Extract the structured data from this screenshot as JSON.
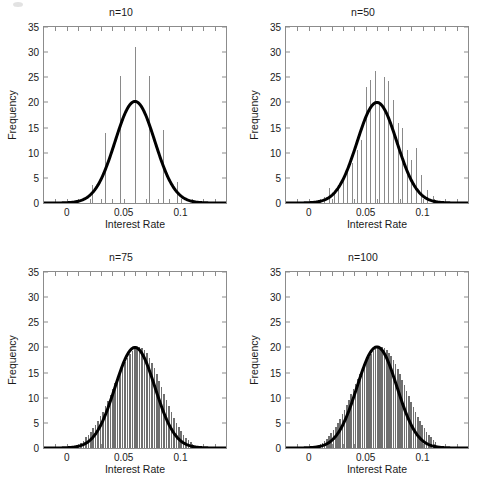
{
  "figure": {
    "width": 484,
    "height": 489,
    "background": "#ffffff",
    "layout": "2x2 grid of histogram subplots with overlaid normal density curve"
  },
  "axes": {
    "ylabel": "Frequency",
    "xlabel": "Interest Rate",
    "ytick_labels": [
      "0",
      "5",
      "10",
      "15",
      "20",
      "25",
      "30",
      "35"
    ],
    "ytick_values": [
      0,
      5,
      10,
      15,
      20,
      25,
      30,
      35
    ],
    "xtick_labels": [
      "0",
      "0.05",
      "0.1"
    ],
    "xtick_values": [
      0,
      0.05,
      0.1
    ],
    "xlim": [
      -0.02,
      0.14
    ],
    "ylim": [
      0,
      35
    ],
    "curve_color": "#000000",
    "bar_color": "#8a8a8a",
    "axis_color": "#8c8c8c",
    "text_color": "#1a1a1a"
  },
  "chart_data": [
    {
      "type": "bar",
      "title": "n=10",
      "xlabel": "Interest Rate",
      "ylabel": "Frequency",
      "xlim": [
        -0.02,
        0.14
      ],
      "ylim": [
        0,
        35
      ],
      "grid": false,
      "legend": "none",
      "bin_centers": [
        0.0225,
        0.0345,
        0.0475,
        0.06,
        0.0725,
        0.085,
        0.0975
      ],
      "values": [
        3.6,
        14.0,
        25.2,
        31.0,
        25.3,
        14.5,
        4.2
      ],
      "overlay_curve": {
        "name": "normal density",
        "mean": 0.06,
        "sigma": 0.0175,
        "peak": 20.2,
        "color": "#000000",
        "linewidth": 3
      }
    },
    {
      "type": "bar",
      "title": "n=50",
      "xlabel": "Interest Rate",
      "ylabel": "Frequency",
      "xlim": [
        -0.02,
        0.14
      ],
      "ylim": [
        0,
        35
      ],
      "grid": false,
      "legend": "none",
      "bin_centers": [
        0.0085,
        0.0135,
        0.0185,
        0.0225,
        0.0265,
        0.0305,
        0.0345,
        0.0385,
        0.0425,
        0.0465,
        0.0505,
        0.0545,
        0.0585,
        0.0625,
        0.0665,
        0.0705,
        0.0745,
        0.0785,
        0.0825,
        0.0865,
        0.0905,
        0.0945,
        0.0995,
        0.1045,
        0.1095
      ],
      "values": [
        0.6,
        1.2,
        3.0,
        1.7,
        3.5,
        5.0,
        6.5,
        8.0,
        10.5,
        12.5,
        23.0,
        24.5,
        26.2,
        20.0,
        25.0,
        24.3,
        20.5,
        16.0,
        15.0,
        10.5,
        8.5,
        11.0,
        5.5,
        2.6,
        1.3
      ],
      "overlay_curve": {
        "name": "normal density",
        "mean": 0.06,
        "sigma": 0.0175,
        "peak": 20.0,
        "color": "#000000",
        "linewidth": 3
      }
    },
    {
      "type": "bar",
      "title": "n=75",
      "xlabel": "Interest Rate",
      "ylabel": "Frequency",
      "xlim": [
        -0.02,
        0.14
      ],
      "ylim": [
        0,
        35
      ],
      "grid": false,
      "legend": "none",
      "bin_count": 46,
      "bin_start": 0.0125,
      "bin_step": 0.00215,
      "values": [
        1.0,
        1.4,
        2.1,
        2.6,
        3.2,
        4.0,
        4.6,
        5.4,
        6.3,
        7.2,
        8.3,
        9.4,
        10.6,
        11.8,
        13.0,
        14.2,
        15.4,
        16.4,
        17.2,
        18.0,
        18.7,
        19.2,
        19.6,
        19.9,
        20.0,
        19.8,
        19.4,
        18.8,
        18.0,
        17.0,
        15.9,
        14.7,
        13.4,
        12.1,
        10.8,
        9.5,
        8.3,
        7.1,
        6.0,
        5.0,
        4.1,
        3.3,
        2.6,
        2.0,
        1.5,
        1.1
      ],
      "overlay_curve": {
        "name": "normal density",
        "mean": 0.06,
        "sigma": 0.0175,
        "peak": 20.0,
        "color": "#000000",
        "linewidth": 3
      }
    },
    {
      "type": "bar",
      "title": "n=100",
      "xlabel": "Interest Rate",
      "ylabel": "Frequency",
      "xlim": [
        -0.02,
        0.14
      ],
      "ylim": [
        0,
        35
      ],
      "grid": false,
      "legend": "none",
      "bin_count": 52,
      "bin_start": 0.012,
      "bin_step": 0.00195,
      "values": [
        0.9,
        1.3,
        1.8,
        2.3,
        2.9,
        3.5,
        4.2,
        5.0,
        5.8,
        6.7,
        7.6,
        8.6,
        9.6,
        10.7,
        11.7,
        12.8,
        13.8,
        14.8,
        15.7,
        16.6,
        17.4,
        18.1,
        18.7,
        19.2,
        19.6,
        19.9,
        20.1,
        20.0,
        19.8,
        19.4,
        18.9,
        18.3,
        17.5,
        16.7,
        15.7,
        14.7,
        13.6,
        12.5,
        11.4,
        10.3,
        9.2,
        8.2,
        7.2,
        6.2,
        5.4,
        4.6,
        3.9,
        3.2,
        2.6,
        2.1,
        1.6,
        1.2
      ],
      "overlay_curve": {
        "name": "normal density",
        "mean": 0.06,
        "sigma": 0.0175,
        "peak": 20.1,
        "color": "#000000",
        "linewidth": 3
      }
    }
  ]
}
